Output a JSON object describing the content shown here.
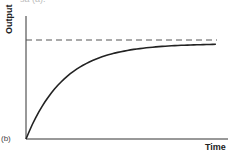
{
  "top_fragment": "sa (a).",
  "panel_label": "(b)",
  "chart_data": {
    "type": "line",
    "title": "",
    "xlabel": "Time",
    "ylabel": "Output",
    "grid": false,
    "legend": null,
    "xlim": [
      0,
      1
    ],
    "ylim": [
      0,
      1
    ],
    "series": [
      {
        "name": "output",
        "style": "solid",
        "x": [
          0,
          0.1,
          0.2,
          0.3,
          0.4,
          0.5,
          0.6,
          0.7,
          0.8,
          0.9,
          0.94
        ],
        "y": [
          0,
          0.39,
          0.63,
          0.78,
          0.86,
          0.91,
          0.94,
          0.955,
          0.96,
          0.962,
          0.963
        ]
      },
      {
        "name": "asymptote",
        "style": "dashed",
        "x": [
          0,
          0.94
        ],
        "y": [
          1,
          1
        ]
      }
    ],
    "annotations": [
      "(b)"
    ]
  }
}
